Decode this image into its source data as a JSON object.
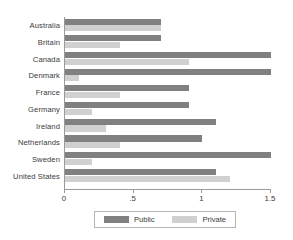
{
  "chart_data": {
    "type": "bar",
    "orientation": "horizontal",
    "title": "",
    "xlabel": "",
    "ylabel": "",
    "xlim": [
      0,
      1.5
    ],
    "grid": false,
    "legend_position": "bottom",
    "categories": [
      "Australia",
      "Britain",
      "Canada",
      "Denmark",
      "France",
      "Germany",
      "Ireland",
      "Netherlands",
      "Sweden",
      "United States"
    ],
    "tick_labels": [
      "0",
      ".5",
      "1",
      "1.5"
    ],
    "tick_values": [
      0,
      0.5,
      1,
      1.5
    ],
    "series": [
      {
        "name": "Public",
        "color": "#808080",
        "values": [
          0.7,
          0.7,
          1.5,
          1.5,
          0.9,
          0.9,
          1.1,
          1.0,
          1.5,
          1.1
        ]
      },
      {
        "name": "Private",
        "color": "#d0d0d0",
        "values": [
          0.7,
          0.4,
          0.9,
          0.1,
          0.4,
          0.2,
          0.3,
          0.4,
          0.2,
          1.2
        ]
      }
    ]
  },
  "legend": {
    "entries": [
      {
        "label": "Public"
      },
      {
        "label": "Private"
      }
    ]
  }
}
